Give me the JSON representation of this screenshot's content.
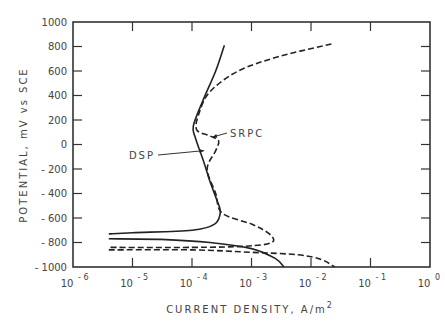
{
  "chart_data": {
    "type": "line",
    "title": "",
    "xlabel": "CURRENT DENSITY, A/m²",
    "ylabel": "POTENTIAL, mV vs SCE",
    "xscale": "log",
    "xlim": [
      1e-06,
      1
    ],
    "ylim": [
      -1000,
      1000
    ],
    "x_tick_labels": [
      "10^-6",
      "10^-5",
      "10^-4",
      "10^-3",
      "10^-2",
      "10^-1",
      "10^0"
    ],
    "y_tick_labels": [
      "1000",
      "800",
      "600",
      "400",
      "200",
      "0",
      "-200",
      "-400",
      "-600",
      "-800",
      "-1000"
    ],
    "grid": false,
    "legend": "annotations with arrows",
    "series": [
      {
        "name": "DSP",
        "style": "solid",
        "points": [
          [
            0.00035,
            810
          ],
          [
            0.00025,
            600
          ],
          [
            0.00015,
            350
          ],
          [
            0.000105,
            150
          ],
          [
            0.000115,
            50
          ],
          [
            0.00016,
            -150
          ],
          [
            0.0002,
            -300
          ],
          [
            0.00026,
            -450
          ],
          [
            0.0003,
            -550
          ],
          [
            0.00024,
            -650
          ],
          [
            0.0001,
            -700
          ],
          [
            1e-05,
            -720
          ],
          [
            4e-06,
            -730
          ]
        ],
        "cathodic_branch": [
          [
            4e-06,
            -770
          ],
          [
            3e-05,
            -775
          ],
          [
            0.0002,
            -800
          ],
          [
            0.001,
            -850
          ],
          [
            0.0025,
            -930
          ],
          [
            0.0035,
            -1000
          ]
        ]
      },
      {
        "name": "SRPC",
        "style": "dashed",
        "points": [
          [
            0.022,
            820
          ],
          [
            0.003,
            720
          ],
          [
            0.0006,
            600
          ],
          [
            0.0002,
            430
          ],
          [
            0.00013,
            250
          ],
          [
            0.00012,
            120
          ],
          [
            0.0002,
            70
          ],
          [
            0.00028,
            30
          ],
          [
            0.00025,
            -50
          ],
          [
            0.00018,
            -200
          ],
          [
            0.00025,
            -400
          ],
          [
            0.00032,
            -560
          ],
          [
            0.001,
            -650
          ],
          [
            0.002,
            -730
          ],
          [
            0.0022,
            -800
          ],
          [
            0.0008,
            -830
          ],
          [
            0.0001,
            -840
          ],
          [
            4e-06,
            -840
          ]
        ],
        "cathodic_branch": [
          [
            4e-06,
            -860
          ],
          [
            0.0001,
            -860
          ],
          [
            0.001,
            -880
          ],
          [
            0.006,
            -900
          ],
          [
            0.015,
            -940
          ],
          [
            0.025,
            -1000
          ]
        ]
      }
    ],
    "annotations": [
      {
        "text": "SRPC",
        "points_to": [
          0.00022,
          60
        ]
      },
      {
        "text": "DSP",
        "points_to": [
          0.00016,
          -50
        ]
      }
    ]
  }
}
